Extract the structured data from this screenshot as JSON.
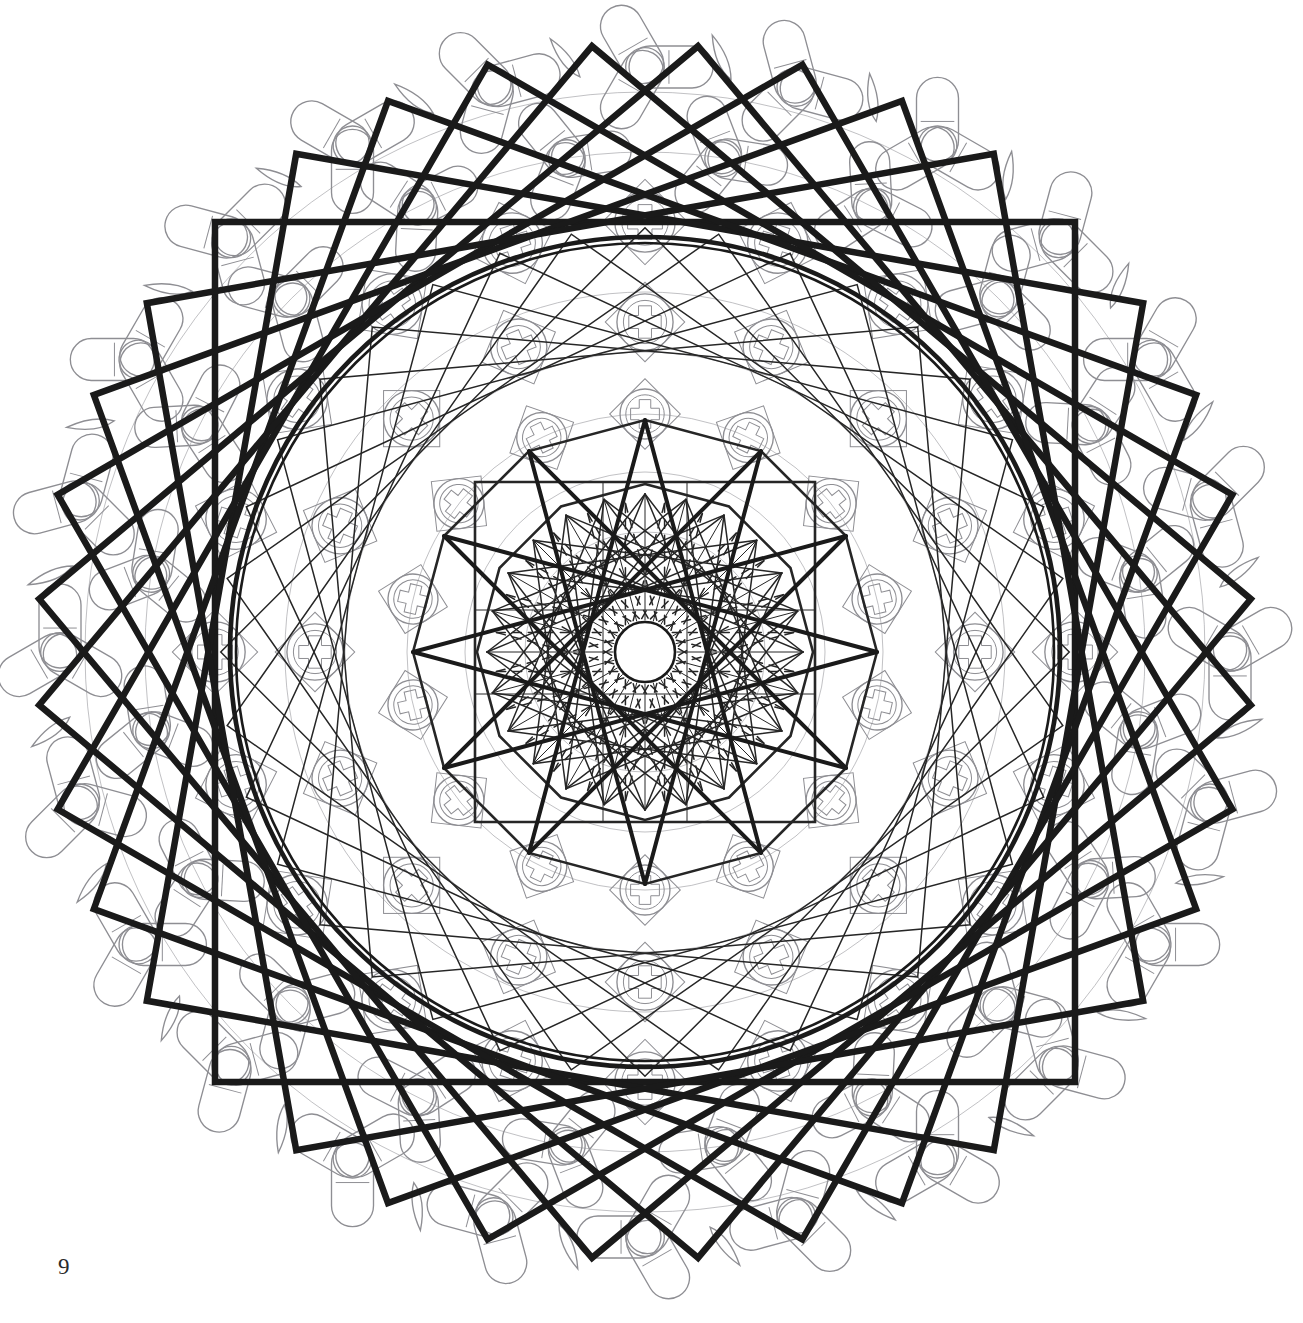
{
  "page": {
    "kind": "coloring-book-page",
    "folio_number": "9",
    "background_color": "#ffffff",
    "width": 1303,
    "height": 1323
  },
  "artwork": {
    "title": "Geometric Rosette Mandala",
    "center": {
      "x": 645,
      "y": 652
    },
    "colors": {
      "bold_line": "#1a1a1a",
      "thin_line": "#262626",
      "faint_line": "#8e8e93",
      "paper": "#ffffff"
    },
    "stroke_widths": {
      "bold": 6.5,
      "medium": 2.6,
      "thin": 1.5,
      "faint": 1.35,
      "hairline": 1.0
    },
    "layers": [
      {
        "name": "outer-rosette-ring",
        "shade": "faint",
        "description": "ring of trefoil rosettes and curved triangles"
      },
      {
        "name": "mid-lattice-ring",
        "shade": "faint",
        "description": "interlocking circles and cross lattice"
      },
      {
        "name": "bold-rotated-squares",
        "shade": "bold",
        "description": "stack of large rotated squares forming a star"
      },
      {
        "name": "bold-circle",
        "shade": "bold",
        "description": "large inscribed circle"
      },
      {
        "name": "thin-rotated-squares",
        "shade": "thin",
        "description": "stack of medium rotated squares"
      },
      {
        "name": "inner-square",
        "shade": "thin",
        "description": "axis aligned inner square"
      },
      {
        "name": "inner-star-burst",
        "shade": "thin",
        "description": "star polygon chords around the hub"
      },
      {
        "name": "center-hub",
        "shade": "bold",
        "description": "blank white circle at the centre"
      }
    ],
    "geometry": {
      "outer_rosette_ring": {
        "radius": 585,
        "count": 24,
        "motif_radius": 42
      },
      "outer_triangle_ring": {
        "radius": 600,
        "count": 24
      },
      "inner_rosette_ring": {
        "radius": 500,
        "count": 20,
        "motif_radius": 40
      },
      "lattice_ring_1": {
        "radius": 430,
        "count": 20,
        "cell": 58
      },
      "lattice_ring_2": {
        "radius": 330,
        "count": 16,
        "cell": 54
      },
      "lattice_ring_3": {
        "radius": 238,
        "count": 14,
        "cell": 48
      },
      "bold_squares": {
        "count": 9,
        "half_size": 430,
        "rotation_step": 10,
        "rotation_start": 0
      },
      "bold_circle": {
        "radius": 415
      },
      "thin_squares": {
        "count": 9,
        "half_size": 300,
        "rotation_step": 10,
        "rotation_start": 5
      },
      "mid_polygon": {
        "sides": 12,
        "radius": 232
      },
      "inner_square": {
        "half_size": 170
      },
      "inner_polygon": {
        "sides": 12,
        "radius": 168
      },
      "star_burst": {
        "points": 24,
        "radius": 158,
        "step": 9
      },
      "star_burst_dashed": {
        "points": 24,
        "radius": 150,
        "step": 11
      },
      "hub": {
        "radius": 30
      }
    }
  }
}
